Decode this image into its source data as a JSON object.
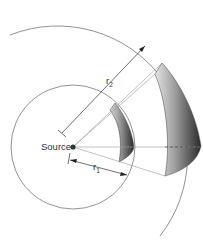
{
  "diagram": {
    "source_label": "Source",
    "r1_label": "r",
    "r1_subscript": "1",
    "r2_label": "r",
    "r2_subscript": "2",
    "colors": {
      "line": "#777777",
      "dark_line": "#333333",
      "shade_dark": "#2e2e2e",
      "shade_light": "#d8d8d8",
      "background": "#ffffff"
    }
  }
}
